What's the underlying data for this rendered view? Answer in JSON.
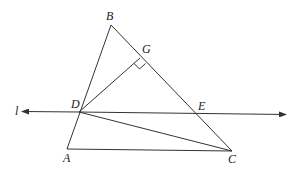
{
  "diagram": {
    "type": "geometry",
    "colors": {
      "stroke": "#333333",
      "background": "#ffffff"
    },
    "points": {
      "A": {
        "label": "A",
        "x": 67,
        "y": 149
      },
      "B": {
        "label": "B",
        "x": 111,
        "y": 25
      },
      "C": {
        "label": "C",
        "x": 232,
        "y": 151
      },
      "D": {
        "label": "D",
        "x": 79,
        "y": 112
      },
      "E": {
        "label": "E",
        "x": 197,
        "y": 114
      },
      "G": {
        "label": "G",
        "x": 140,
        "y": 58
      }
    },
    "line_l": {
      "label": "l"
    },
    "segments": [
      "AB",
      "BC",
      "AC",
      "DG",
      "DC"
    ],
    "right_angle_at": "G"
  }
}
